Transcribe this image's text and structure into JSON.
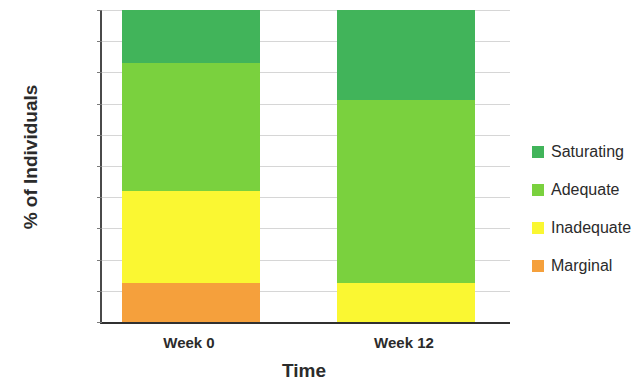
{
  "chart_data": {
    "type": "bar",
    "stacked": true,
    "stack_total": 100,
    "title": "",
    "xlabel": "Time",
    "ylabel": "% of Individuals",
    "categories": [
      "Week 0",
      "Week 12"
    ],
    "ylim": [
      0,
      100
    ],
    "ytick_labels": [
      "0%",
      "10%",
      "20%",
      "30%",
      "40%",
      "50%",
      "60%",
      "70%",
      "80%",
      "90%",
      "100%"
    ],
    "ytick_values": [
      0,
      10,
      20,
      30,
      40,
      50,
      60,
      70,
      80,
      90,
      100
    ],
    "grid": true,
    "legend_position": "right",
    "series": [
      {
        "name": "Marginal",
        "color": "#F5A03C",
        "values": [
          12.5,
          0
        ]
      },
      {
        "name": "Inadequate",
        "color": "#FAF732",
        "values": [
          29.5,
          12.5
        ]
      },
      {
        "name": "Adequate",
        "color": "#7AD13E",
        "values": [
          41.0,
          58.5
        ]
      },
      {
        "name": "Saturating",
        "color": "#41B45A",
        "values": [
          17.0,
          29.0
        ]
      }
    ],
    "legend_order": [
      "Saturating",
      "Adequate",
      "Inadequate",
      "Marginal"
    ],
    "cumulative_tops": {
      "Week 0": {
        "Marginal": 12.5,
        "Inadequate": 42.0,
        "Adequate": 83.0,
        "Saturating": 100.0
      },
      "Week 12": {
        "Marginal": 0.0,
        "Inadequate": 12.5,
        "Adequate": 71.0,
        "Saturating": 100.0
      }
    }
  },
  "legend": {
    "items": [
      {
        "label": "Saturating",
        "color": "#41B45A"
      },
      {
        "label": "Adequate",
        "color": "#7AD13E"
      },
      {
        "label": "Inadequate",
        "color": "#FAF732"
      },
      {
        "label": "Marginal",
        "color": "#F5A03C"
      }
    ]
  },
  "axes": {
    "y_title": "% of Individuals",
    "x_title": "Time"
  }
}
